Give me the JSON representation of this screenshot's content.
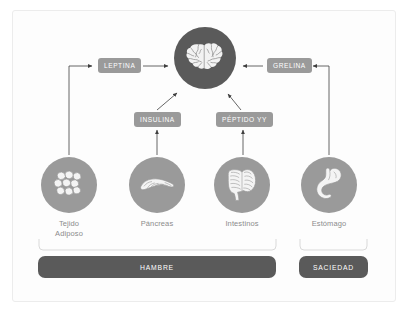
{
  "diagram": {
    "colors": {
      "brain_circle": "#5a5a5a",
      "organ_circle": "#9a9a9a",
      "pill": "#9a9a9a",
      "bar": "#5a5a5a",
      "label_text": "#8c8c8c",
      "pill_text": "#ffffff",
      "bar_text": "#ffffff",
      "connector": "#3f3f3f",
      "bracket": "#d0d0d0",
      "frame_border": "#ececec",
      "background": "#ffffff"
    }
  },
  "brain": {
    "icon": "brain-icon",
    "label": ""
  },
  "organs": [
    {
      "id": "adiposo",
      "label": "Tejido\nAdiposo",
      "icon": "fat-cells-icon"
    },
    {
      "id": "pancreas",
      "label": "Páncreas",
      "icon": "pancreas-icon"
    },
    {
      "id": "intestino",
      "label": "Intestinos",
      "icon": "intestines-icon"
    },
    {
      "id": "estomago",
      "label": "Estómago",
      "icon": "stomach-icon"
    }
  ],
  "hormones": [
    {
      "id": "leptina",
      "label": "LEPTINA",
      "source": "adiposo",
      "target": "brain"
    },
    {
      "id": "insulina",
      "label": "INSULINA",
      "source": "pancreas",
      "target": "brain"
    },
    {
      "id": "peptido",
      "label": "PÉPTIDO YY",
      "source": "intestino",
      "target": "brain"
    },
    {
      "id": "grelina",
      "label": "GRELINA",
      "source": "estomago",
      "target": "brain"
    }
  ],
  "categories": [
    {
      "id": "hambre",
      "label": "HAMBRE",
      "covers": [
        "adiposo",
        "pancreas",
        "intestino"
      ]
    },
    {
      "id": "saciedad",
      "label": "SACIEDAD",
      "covers": [
        "estomago"
      ]
    }
  ]
}
